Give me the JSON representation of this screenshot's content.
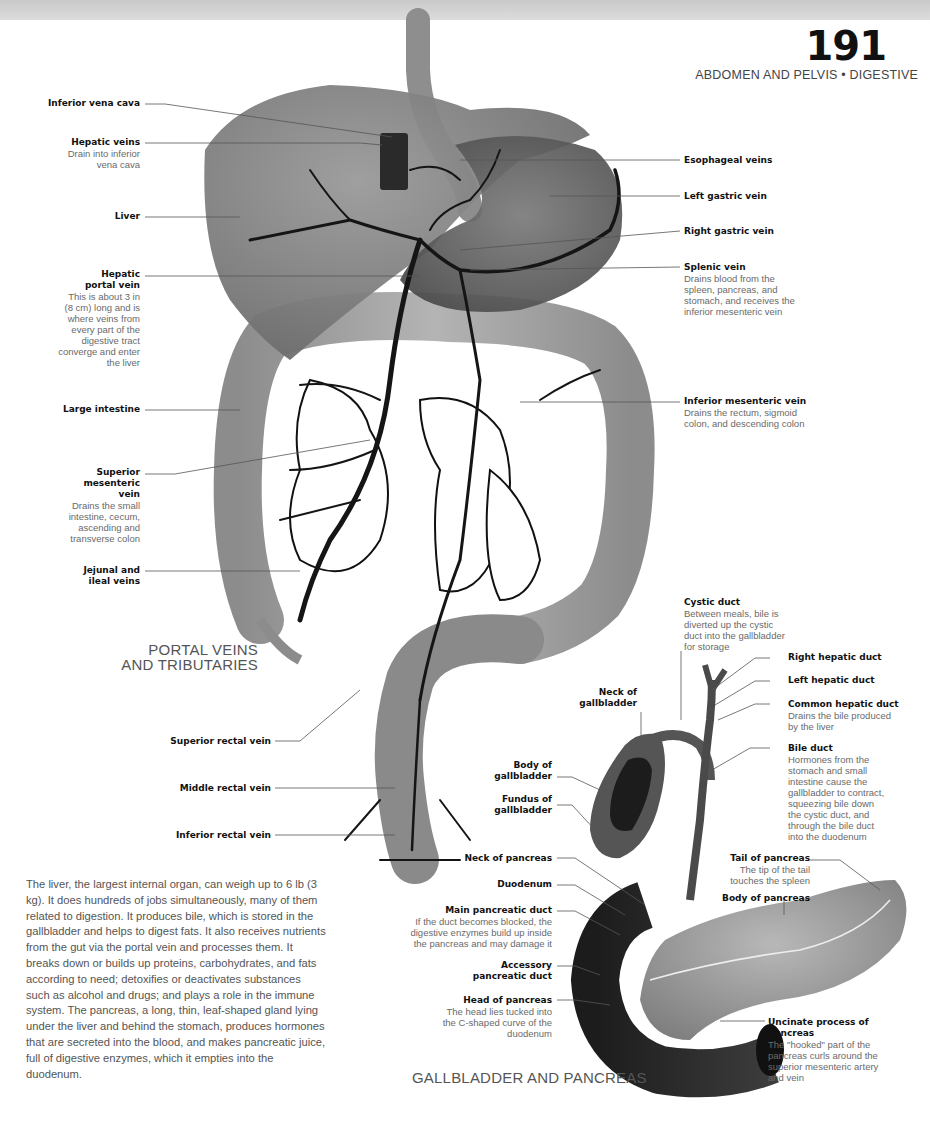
{
  "header": {
    "page_number": "191",
    "section": "ABDOMEN AND PELVIS • DIGESTIVE"
  },
  "portal": {
    "caption_line1": "PORTAL VEINS",
    "caption_line2": "AND TRIBUTARIES",
    "left_labels": [
      {
        "title": "Inferior vena cava",
        "desc": ""
      },
      {
        "title": "Hepatic veins",
        "desc": "Drain into inferior vena cava"
      },
      {
        "title": "Liver",
        "desc": ""
      },
      {
        "title": "Hepatic portal vein",
        "desc": "This is about 3 in (8 cm) long and is where veins from every part of the digestive tract converge and enter the liver"
      },
      {
        "title": "Large intestine",
        "desc": ""
      },
      {
        "title": "Superior mesenteric vein",
        "desc": "Drains the small intestine, cecum, ascending and transverse colon"
      },
      {
        "title": "Jejunal and ileal veins",
        "desc": ""
      },
      {
        "title": "Superior rectal vein",
        "desc": ""
      },
      {
        "title": "Middle rectal vein",
        "desc": ""
      },
      {
        "title": "Inferior rectal vein",
        "desc": ""
      }
    ],
    "right_labels": [
      {
        "title": "Esophageal veins",
        "desc": ""
      },
      {
        "title": "Left gastric vein",
        "desc": ""
      },
      {
        "title": "Right gastric vein",
        "desc": ""
      },
      {
        "title": "Splenic vein",
        "desc": "Drains blood from the spleen, pancreas, and stomach, and receives the inferior mesenteric vein"
      },
      {
        "title": "Inferior mesenteric vein",
        "desc": "Drains the rectum, sigmoid colon, and descending colon"
      }
    ]
  },
  "gallbladder": {
    "caption": "GALLBLADDER AND PANCREAS",
    "labels": {
      "cystic_duct": {
        "title": "Cystic duct",
        "desc": "Between meals, bile is diverted up the cystic duct into the gallbladder for storage"
      },
      "right_hepatic_duct": {
        "title": "Right hepatic duct",
        "desc": ""
      },
      "left_hepatic_duct": {
        "title": "Left hepatic duct",
        "desc": ""
      },
      "common_hepatic_duct": {
        "title": "Common hepatic duct",
        "desc": "Drains the bile produced by the liver"
      },
      "bile_duct": {
        "title": "Bile duct",
        "desc": "Hormones from the stomach and small intestine cause the gallbladder to contract, squeezing bile down the cystic duct, and through the bile duct into the duodenum"
      },
      "neck_gallbladder": {
        "title": "Neck of gallbladder",
        "desc": ""
      },
      "body_gallbladder": {
        "title": "Body of gallbladder",
        "desc": ""
      },
      "fundus_gallbladder": {
        "title": "Fundus of gallbladder",
        "desc": ""
      },
      "neck_pancreas": {
        "title": "Neck of pancreas",
        "desc": ""
      },
      "duodenum": {
        "title": "Duodenum",
        "desc": ""
      },
      "main_pancreatic_duct": {
        "title": "Main pancreatic duct",
        "desc": "If the duct becomes blocked, the digestive enzymes build up inside the pancreas and may damage it"
      },
      "accessory_pancreatic_duct": {
        "title": "Accessory pancreatic duct",
        "desc": ""
      },
      "head_pancreas": {
        "title": "Head of pancreas",
        "desc": "The head lies tucked into the C-shaped curve of the duodenum"
      },
      "tail_pancreas": {
        "title": "Tail of pancreas",
        "desc": "The tip of the tail touches the spleen"
      },
      "body_pancreas": {
        "title": "Body of pancreas",
        "desc": ""
      },
      "uncinate_process": {
        "title": "Uncinate process of pancreas",
        "desc": "The \"hooked\" part of the pancreas curls around the superior mesenteric artery and vein"
      }
    }
  },
  "body_text": "The liver, the largest internal organ, can weigh up to 6 lb (3 kg). It does hundreds of jobs simultaneously, many of them related to digestion. It produces bile, which is stored in the gallbladder and helps to digest fats. It also receives nutrients from the gut via the portal vein and processes them. It breaks down or builds up proteins, carbohydrates, and fats according to need; detoxifies or deactivates substances such as alcohol and drugs; and plays a role in the immune system. The pancreas, a long, thin, leaf-shaped gland lying under the liver and behind the stomach, produces hormones that are secreted into the blood, and makes pancreatic juice, full of digestive enzymes, which it empties into the duodenum.",
  "colors": {
    "organ_gray": "#8a8a8a",
    "dark_organ": "#3a3a3a",
    "vein": "#151515",
    "leader_line": "#555555",
    "desc_text": "#6a6a6a"
  }
}
